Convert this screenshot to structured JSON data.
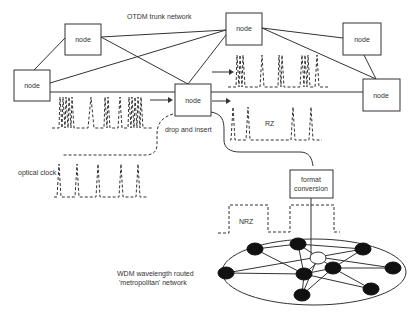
{
  "diagram": {
    "title": "OTDM trunk network",
    "labels": {
      "drop_insert": "drop and insert",
      "optical_clock": "optical clock",
      "rz": "RZ",
      "nrz": "NRZ",
      "format_conversion_line1": "format",
      "format_conversion_line2": "conversion",
      "wdm_line1": "WDM wavelength routed",
      "wdm_line2": "'metropolitan' network"
    },
    "nodes": [
      {
        "id": "n1",
        "label": "node",
        "x": 65,
        "y": 24,
        "w": 36,
        "h": 31
      },
      {
        "id": "n2",
        "label": "node",
        "x": 14,
        "y": 70,
        "w": 36,
        "h": 31
      },
      {
        "id": "n3",
        "label": "node",
        "x": 175,
        "y": 84,
        "w": 36,
        "h": 32
      },
      {
        "id": "n4",
        "label": "node",
        "x": 226,
        "y": 13,
        "w": 36,
        "h": 32
      },
      {
        "id": "n5",
        "label": "node",
        "x": 343,
        "y": 23,
        "w": 38,
        "h": 32
      },
      {
        "id": "n6",
        "label": "node",
        "x": 363,
        "y": 79,
        "w": 37,
        "h": 32
      }
    ],
    "wdm_network": {
      "center_node": "hollow",
      "filled_nodes": 9,
      "connected_via": "format conversion"
    }
  }
}
